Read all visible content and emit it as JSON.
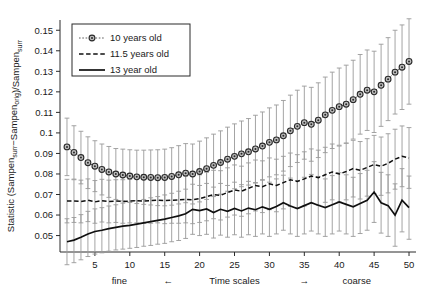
{
  "chart_data": {
    "type": "line",
    "title": "",
    "xlabel": "Time scales",
    "xlabel_left": "fine",
    "xlabel_right": "coarse",
    "arrow_left": "←",
    "arrow_right": "→",
    "ylabel": "Statistic (Sampen_surr − Sampen_orig)/Sampen_surr",
    "ylabel_parts": {
      "p1": "Statistic (Sampen",
      "sub1": "surr",
      "p2": "−Sampen",
      "sub2": "orig",
      "p3": ")/Sampen",
      "sub3": "surr"
    },
    "xlim": [
      0,
      51
    ],
    "ylim": [
      0.042,
      0.155
    ],
    "xticks": [
      5,
      10,
      15,
      20,
      25,
      30,
      35,
      40,
      45,
      50
    ],
    "yticks": [
      0.05,
      0.06,
      0.07,
      0.08,
      0.09,
      0.1,
      0.11,
      0.12,
      0.13,
      0.14,
      0.15
    ],
    "ytick_labels": [
      "0.05",
      "0.06",
      "0.07",
      "0.08",
      "0.09",
      "0.1",
      "0.11",
      "0.12",
      "0.13",
      "0.14",
      "0.15"
    ],
    "grid": false,
    "legend_position": "upper-left",
    "x": [
      1,
      2,
      3,
      4,
      5,
      6,
      7,
      8,
      9,
      10,
      11,
      12,
      13,
      14,
      15,
      16,
      17,
      18,
      19,
      20,
      21,
      22,
      23,
      24,
      25,
      26,
      27,
      28,
      29,
      30,
      31,
      32,
      33,
      34,
      35,
      36,
      37,
      38,
      39,
      40,
      41,
      42,
      43,
      44,
      45,
      46,
      47,
      48,
      49,
      50
    ],
    "series": [
      {
        "name": "10 years old",
        "style": "dotted-marker",
        "marker": "circle",
        "color": "#4a4a4a",
        "values": [
          0.0932,
          0.0905,
          0.088,
          0.0855,
          0.0838,
          0.0822,
          0.081,
          0.08,
          0.0795,
          0.079,
          0.0786,
          0.0784,
          0.0783,
          0.0782,
          0.0783,
          0.0788,
          0.0796,
          0.0804,
          0.08,
          0.0812,
          0.0826,
          0.0842,
          0.0856,
          0.0872,
          0.0886,
          0.0898,
          0.0908,
          0.0922,
          0.0936,
          0.0954,
          0.0966,
          0.0986,
          0.101,
          0.1032,
          0.105,
          0.1042,
          0.1062,
          0.1088,
          0.111,
          0.1128,
          0.114,
          0.1162,
          0.1188,
          0.1208,
          0.12,
          0.1232,
          0.1262,
          0.1296,
          0.132,
          0.1348
        ],
        "err_low": [
          0.014,
          0.013,
          0.0128,
          0.0126,
          0.0124,
          0.0124,
          0.0124,
          0.0124,
          0.0126,
          0.0128,
          0.013,
          0.0132,
          0.0134,
          0.0136,
          0.0138,
          0.014,
          0.0142,
          0.0144,
          0.0146,
          0.0148,
          0.015,
          0.0152,
          0.0154,
          0.0156,
          0.0158,
          0.016,
          0.0162,
          0.0164,
          0.0166,
          0.0168,
          0.017,
          0.0172,
          0.0174,
          0.0176,
          0.0178,
          0.018,
          0.0182,
          0.0184,
          0.0186,
          0.0188,
          0.019,
          0.0192,
          0.0194,
          0.0196,
          0.0198,
          0.02,
          0.0202,
          0.0204,
          0.0206,
          0.0208
        ],
        "err_high": [
          0.014,
          0.013,
          0.0128,
          0.0126,
          0.0124,
          0.0124,
          0.0124,
          0.0124,
          0.0126,
          0.0128,
          0.013,
          0.0132,
          0.0134,
          0.0136,
          0.0138,
          0.014,
          0.0142,
          0.0144,
          0.0146,
          0.0148,
          0.015,
          0.0152,
          0.0154,
          0.0156,
          0.0158,
          0.016,
          0.0162,
          0.0164,
          0.0166,
          0.0168,
          0.017,
          0.0172,
          0.0174,
          0.0176,
          0.0178,
          0.018,
          0.0182,
          0.0184,
          0.0186,
          0.0188,
          0.019,
          0.0192,
          0.0194,
          0.0196,
          0.0198,
          0.02,
          0.0202,
          0.0204,
          0.0206,
          0.0208
        ]
      },
      {
        "name": "11.5 years old",
        "style": "dashed",
        "marker": "none",
        "color": "#101010",
        "values": [
          0.0668,
          0.0668,
          0.0666,
          0.0672,
          0.0664,
          0.067,
          0.0666,
          0.0668,
          0.0666,
          0.0668,
          0.067,
          0.0668,
          0.067,
          0.0672,
          0.067,
          0.0672,
          0.0674,
          0.0676,
          0.0674,
          0.068,
          0.069,
          0.07,
          0.0696,
          0.071,
          0.0722,
          0.0716,
          0.073,
          0.0744,
          0.0738,
          0.0752,
          0.0744,
          0.0758,
          0.0772,
          0.0764,
          0.0776,
          0.079,
          0.0782,
          0.0796,
          0.081,
          0.08,
          0.0812,
          0.0826,
          0.0818,
          0.0832,
          0.0846,
          0.0838,
          0.0852,
          0.0872,
          0.0886,
          0.0878
        ],
        "err_low": [
          0.0106,
          0.0104,
          0.0104,
          0.0104,
          0.0104,
          0.0104,
          0.0104,
          0.0104,
          0.0106,
          0.0106,
          0.0108,
          0.0108,
          0.011,
          0.011,
          0.0112,
          0.0112,
          0.0114,
          0.0114,
          0.0116,
          0.0116,
          0.0118,
          0.0118,
          0.012,
          0.012,
          0.0122,
          0.0122,
          0.0124,
          0.0124,
          0.0126,
          0.0126,
          0.0128,
          0.0128,
          0.013,
          0.013,
          0.0132,
          0.0132,
          0.0134,
          0.0134,
          0.0136,
          0.0136,
          0.0138,
          0.0138,
          0.014,
          0.014,
          0.0142,
          0.0142,
          0.0144,
          0.0146,
          0.0148,
          0.0148
        ],
        "err_high": [
          0.0106,
          0.0104,
          0.0104,
          0.0104,
          0.0104,
          0.0104,
          0.0104,
          0.0104,
          0.0106,
          0.0106,
          0.0108,
          0.0108,
          0.011,
          0.011,
          0.0112,
          0.0112,
          0.0114,
          0.0114,
          0.0116,
          0.0116,
          0.0118,
          0.0118,
          0.012,
          0.012,
          0.0122,
          0.0122,
          0.0124,
          0.0124,
          0.0126,
          0.0126,
          0.0128,
          0.0128,
          0.013,
          0.013,
          0.0132,
          0.0132,
          0.0134,
          0.0134,
          0.0136,
          0.0136,
          0.0138,
          0.0138,
          0.014,
          0.014,
          0.0142,
          0.0142,
          0.0144,
          0.0146,
          0.0148,
          0.0148
        ]
      },
      {
        "name": "13 year old",
        "style": "solid",
        "marker": "none",
        "color": "#101010",
        "values": [
          0.047,
          0.0478,
          0.0492,
          0.0508,
          0.052,
          0.0526,
          0.0534,
          0.054,
          0.0546,
          0.055,
          0.0556,
          0.0562,
          0.0568,
          0.0574,
          0.058,
          0.0588,
          0.0596,
          0.0606,
          0.0628,
          0.0622,
          0.063,
          0.0612,
          0.0628,
          0.0618,
          0.0632,
          0.062,
          0.0634,
          0.0626,
          0.064,
          0.0628,
          0.0642,
          0.066,
          0.0644,
          0.0632,
          0.0646,
          0.066,
          0.0648,
          0.0636,
          0.065,
          0.0664,
          0.0652,
          0.064,
          0.0656,
          0.0672,
          0.0712,
          0.066,
          0.0646,
          0.06,
          0.0672,
          0.0636
        ],
        "err_low": [
          0.0112,
          0.011,
          0.011,
          0.011,
          0.011,
          0.011,
          0.011,
          0.011,
          0.0112,
          0.0112,
          0.0114,
          0.0114,
          0.0116,
          0.0116,
          0.0118,
          0.0118,
          0.012,
          0.012,
          0.0122,
          0.0122,
          0.0124,
          0.0124,
          0.0126,
          0.0126,
          0.0128,
          0.0128,
          0.013,
          0.013,
          0.0132,
          0.0132,
          0.0134,
          0.0134,
          0.0136,
          0.0136,
          0.0138,
          0.0138,
          0.014,
          0.014,
          0.0142,
          0.0142,
          0.0144,
          0.0144,
          0.0146,
          0.0146,
          0.0148,
          0.0148,
          0.015,
          0.0152,
          0.0154,
          0.0154
        ],
        "err_high": [
          0.0112,
          0.011,
          0.011,
          0.011,
          0.011,
          0.011,
          0.011,
          0.011,
          0.0112,
          0.0112,
          0.0114,
          0.0114,
          0.0116,
          0.0116,
          0.0118,
          0.0118,
          0.012,
          0.012,
          0.0122,
          0.0122,
          0.0124,
          0.0124,
          0.0126,
          0.0126,
          0.0128,
          0.0128,
          0.013,
          0.013,
          0.0132,
          0.0132,
          0.0134,
          0.0134,
          0.0136,
          0.0136,
          0.0138,
          0.0138,
          0.014,
          0.014,
          0.0142,
          0.0142,
          0.0144,
          0.0144,
          0.0146,
          0.0146,
          0.0148,
          0.0148,
          0.015,
          0.0152,
          0.0154,
          0.0154
        ]
      }
    ],
    "legend": [
      {
        "label": "10 years old",
        "style": "dotted-marker"
      },
      {
        "label": "11.5 years old",
        "style": "dashed"
      },
      {
        "label": "13 year old",
        "style": "solid"
      }
    ]
  }
}
